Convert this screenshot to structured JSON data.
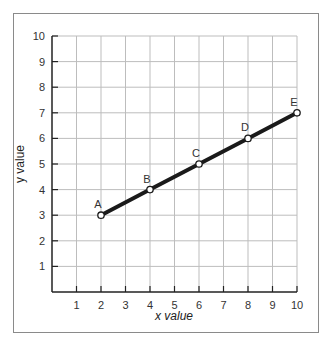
{
  "chart_data": {
    "type": "line",
    "title": "",
    "xlabel": "x value",
    "ylabel": "y value",
    "xlim": [
      0,
      10
    ],
    "ylim": [
      0,
      10
    ],
    "grid": true,
    "legend": null,
    "x_ticks": [
      1,
      2,
      3,
      4,
      5,
      6,
      7,
      8,
      9,
      10
    ],
    "y_ticks": [
      1,
      2,
      3,
      4,
      5,
      6,
      7,
      8,
      9,
      10
    ],
    "series": [
      {
        "name": "line",
        "points": [
          {
            "label": "A",
            "x": 2,
            "y": 3
          },
          {
            "label": "B",
            "x": 4,
            "y": 4
          },
          {
            "label": "C",
            "x": 6,
            "y": 5
          },
          {
            "label": "D",
            "x": 8,
            "y": 6
          },
          {
            "label": "E",
            "x": 10,
            "y": 7
          }
        ]
      }
    ],
    "colors": {
      "line": "#1a1a1a",
      "grid": "#bdbdbd",
      "axis": "#222222",
      "frame": "#8a8a8a",
      "marker_fill": "#ffffff"
    }
  }
}
